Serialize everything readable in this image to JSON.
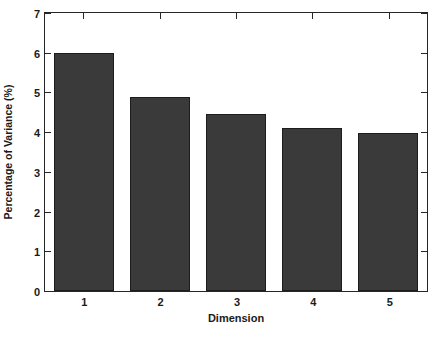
{
  "chart_data": {
    "type": "bar",
    "title": "",
    "xlabel": "Dimension",
    "ylabel": "Percentage of Variance (%)",
    "categories": [
      "1",
      "2",
      "3",
      "4",
      "5"
    ],
    "values": [
      6.0,
      4.88,
      4.45,
      4.1,
      3.97
    ],
    "series": [
      {
        "name": "Percentage of Variance",
        "values": [
          6.0,
          4.88,
          4.45,
          4.1,
          3.97
        ]
      }
    ],
    "ylim": [
      0,
      7
    ],
    "yticks": [
      "0",
      "1",
      "2",
      "3",
      "4",
      "5",
      "6",
      "7"
    ],
    "xticks": [
      "1",
      "2",
      "3",
      "4",
      "5"
    ],
    "grid": false,
    "legend": null,
    "bar_color": "#3a3a3a",
    "bar_edge_color": "#1d1d1d",
    "axis_color": "#262626",
    "background_color": "#ffffff"
  }
}
